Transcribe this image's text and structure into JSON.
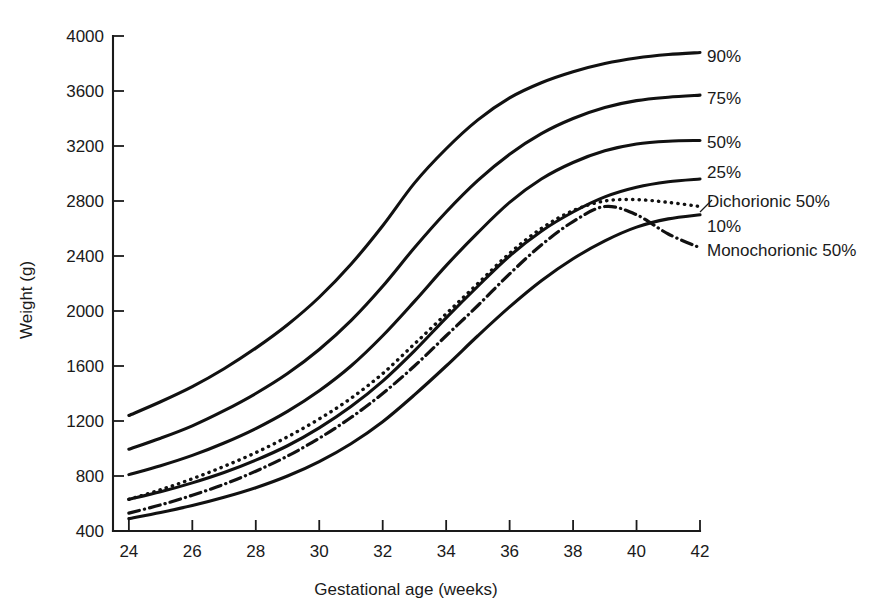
{
  "chart_data": {
    "type": "line",
    "title": "",
    "xlabel": "Gestational age (weeks)",
    "ylabel": "Weight (g)",
    "xlim": [
      23.5,
      42
    ],
    "ylim": [
      400,
      4000
    ],
    "xticks": [
      24,
      26,
      28,
      30,
      32,
      34,
      36,
      38,
      40,
      42
    ],
    "yticks": [
      400,
      800,
      1200,
      1600,
      2000,
      2400,
      2800,
      3200,
      3600,
      4000
    ],
    "xtick_labels": [
      "24",
      "26",
      "28",
      "30",
      "32",
      "34",
      "36",
      "38",
      "40",
      "42"
    ],
    "ytick_labels": [
      "400",
      "800",
      "1200",
      "1600",
      "2000",
      "2400",
      "2800",
      "3200",
      "3600",
      "4000"
    ],
    "grid": false,
    "legend_position": "right-of-axes-inline-labels",
    "x": [
      24,
      25,
      26,
      27,
      28,
      29,
      30,
      31,
      32,
      33,
      34,
      35,
      36,
      37,
      38,
      39,
      40,
      41,
      42
    ],
    "series": [
      {
        "name": "90%",
        "label": "90%",
        "style": "solid",
        "values": [
          1240,
          1340,
          1450,
          1580,
          1730,
          1900,
          2100,
          2340,
          2620,
          2930,
          3180,
          3390,
          3550,
          3660,
          3740,
          3800,
          3840,
          3865,
          3880
        ]
      },
      {
        "name": "75%",
        "label": "75%",
        "style": "solid",
        "values": [
          995,
          1075,
          1165,
          1275,
          1400,
          1545,
          1720,
          1930,
          2180,
          2460,
          2720,
          2950,
          3140,
          3290,
          3400,
          3480,
          3530,
          3555,
          3570
        ]
      },
      {
        "name": "50%",
        "label": "50%",
        "style": "solid",
        "values": [
          810,
          875,
          950,
          1040,
          1145,
          1270,
          1420,
          1600,
          1820,
          2070,
          2330,
          2570,
          2790,
          2960,
          3080,
          3165,
          3215,
          3235,
          3240
        ]
      },
      {
        "name": "25%",
        "label": "25%",
        "style": "solid",
        "values": [
          630,
          685,
          750,
          825,
          915,
          1020,
          1150,
          1305,
          1490,
          1710,
          1950,
          2180,
          2400,
          2580,
          2720,
          2830,
          2900,
          2940,
          2960
        ]
      },
      {
        "name": "Dichorionic 50%",
        "label": "Dichorionic 50%",
        "style": "dotted",
        "values": [
          630,
          700,
          780,
          870,
          970,
          1085,
          1215,
          1365,
          1545,
          1760,
          1980,
          2200,
          2420,
          2600,
          2730,
          2800,
          2810,
          2790,
          2760
        ]
      },
      {
        "name": "10%",
        "label": "10%",
        "style": "solid",
        "values": [
          490,
          535,
          585,
          645,
          715,
          800,
          905,
          1035,
          1195,
          1390,
          1600,
          1820,
          2030,
          2220,
          2380,
          2510,
          2610,
          2670,
          2700
        ]
      },
      {
        "name": "Monochorionic 50%",
        "label": "Monochorionic 50%",
        "style": "dashdot",
        "values": [
          530,
          590,
          660,
          740,
          835,
          945,
          1075,
          1225,
          1400,
          1600,
          1820,
          2040,
          2270,
          2480,
          2650,
          2760,
          2700,
          2560,
          2460
        ]
      }
    ],
    "annotations": [
      {
        "text": "90%",
        "at_x": 42,
        "at_y": 3880
      },
      {
        "text": "75%",
        "at_x": 42,
        "at_y": 3570
      },
      {
        "text": "50%",
        "at_x": 42,
        "at_y": 3240
      },
      {
        "text": "25%",
        "at_x": 42,
        "at_y": 2960
      },
      {
        "text": "Dichorionic 50%",
        "at_x": 42,
        "at_y": 2760
      },
      {
        "text": "10%",
        "at_x": 42,
        "at_y": 2700
      },
      {
        "text": "Monochorionic 50%",
        "at_x": 42,
        "at_y": 2460
      }
    ]
  },
  "colors": {
    "ink": "#111111",
    "axis": "#1a1a1a",
    "background": "#ffffff"
  }
}
